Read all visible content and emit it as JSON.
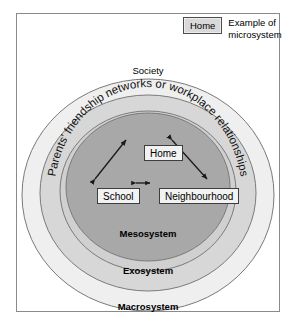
{
  "legend": {
    "box_label": "Home",
    "description": "Example of\nmicrosystem"
  },
  "diagram": {
    "rings": [
      {
        "key": "macrosystem",
        "label": "Macrosystem",
        "inner_label": "Society",
        "color": "#efefef"
      },
      {
        "key": "exosystem",
        "label": "Exosystem",
        "color": "#d7d7d7"
      },
      {
        "key": "mesosystem",
        "label": "Mesosystem",
        "color": "#a8a8a8"
      }
    ],
    "curved_text": "Parents' friendship networks or workplace relationships",
    "microsystems": [
      {
        "key": "home",
        "label": "Home"
      },
      {
        "key": "school",
        "label": "School"
      },
      {
        "key": "neighbourhood",
        "label": "Neighbourhood"
      }
    ],
    "connections": [
      {
        "from": "School",
        "to": "Home",
        "type": "double-arrow"
      },
      {
        "from": "Home",
        "to": "Neighbourhood",
        "type": "double-arrow"
      },
      {
        "from": "School",
        "to": "Neighbourhood",
        "type": "double-arrow"
      }
    ],
    "colors": {
      "macrosystem_fill": "#efefef",
      "exosystem_fill": "#d7d7d7",
      "mesosystem_fill": "#a8a8a8",
      "outline": "#7a7a7a",
      "box_fill": "#f2f2f2",
      "box_border": "#3d3d3d"
    }
  }
}
